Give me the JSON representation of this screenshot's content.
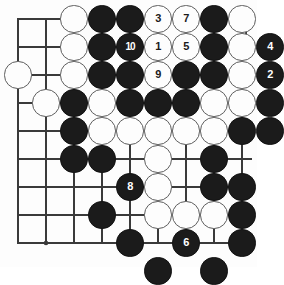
{
  "diagram": {
    "kind": "go-board-problem-diagram",
    "board": {
      "columns": 9,
      "rows": 9,
      "line_color": "#3a3a3a",
      "background_color": "#fdfdfd",
      "star_points": [
        [
          2,
          4
        ],
        [
          2,
          9
        ],
        [
          6,
          4
        ]
      ]
    },
    "colors": {
      "black_stone": "#1b1b1b",
      "white_stone": "#fdfdfd",
      "black_label": "#ffffff",
      "white_label": "#1b1b1b"
    },
    "stones": [
      {
        "col": 3,
        "row": 1,
        "color": "white",
        "label": ""
      },
      {
        "col": 4,
        "row": 1,
        "color": "black",
        "label": ""
      },
      {
        "col": 5,
        "row": 1,
        "color": "black",
        "label": ""
      },
      {
        "col": 6,
        "row": 1,
        "color": "white",
        "label": "3"
      },
      {
        "col": 7,
        "row": 1,
        "color": "white",
        "label": "7"
      },
      {
        "col": 8,
        "row": 1,
        "color": "black",
        "label": ""
      },
      {
        "col": 9,
        "row": 1,
        "color": "white",
        "label": ""
      },
      {
        "col": 3,
        "row": 2,
        "color": "white",
        "label": ""
      },
      {
        "col": 4,
        "row": 2,
        "color": "black",
        "label": ""
      },
      {
        "col": 5,
        "row": 2,
        "color": "black",
        "label": "10"
      },
      {
        "col": 6,
        "row": 2,
        "color": "white",
        "label": "1"
      },
      {
        "col": 7,
        "row": 2,
        "color": "white",
        "label": "5"
      },
      {
        "col": 8,
        "row": 2,
        "color": "black",
        "label": ""
      },
      {
        "col": 9,
        "row": 2,
        "color": "white",
        "label": ""
      },
      {
        "col": 10,
        "row": 2,
        "color": "black",
        "label": "4"
      },
      {
        "col": 1,
        "row": 3,
        "color": "white",
        "label": ""
      },
      {
        "col": 3,
        "row": 3,
        "color": "white",
        "label": ""
      },
      {
        "col": 4,
        "row": 3,
        "color": "black",
        "label": ""
      },
      {
        "col": 5,
        "row": 3,
        "color": "black",
        "label": ""
      },
      {
        "col": 6,
        "row": 3,
        "color": "white",
        "label": "9"
      },
      {
        "col": 7,
        "row": 3,
        "color": "black",
        "label": ""
      },
      {
        "col": 8,
        "row": 3,
        "color": "black",
        "label": ""
      },
      {
        "col": 9,
        "row": 3,
        "color": "white",
        "label": ""
      },
      {
        "col": 10,
        "row": 3,
        "color": "black",
        "label": "2"
      },
      {
        "col": 2,
        "row": 4,
        "color": "white",
        "label": ""
      },
      {
        "col": 3,
        "row": 4,
        "color": "black",
        "label": ""
      },
      {
        "col": 4,
        "row": 4,
        "color": "white",
        "label": ""
      },
      {
        "col": 5,
        "row": 4,
        "color": "black",
        "label": ""
      },
      {
        "col": 6,
        "row": 4,
        "color": "black",
        "label": ""
      },
      {
        "col": 7,
        "row": 4,
        "color": "black",
        "label": ""
      },
      {
        "col": 8,
        "row": 4,
        "color": "white",
        "label": ""
      },
      {
        "col": 9,
        "row": 4,
        "color": "white",
        "label": ""
      },
      {
        "col": 10,
        "row": 4,
        "color": "black",
        "label": ""
      },
      {
        "col": 3,
        "row": 5,
        "color": "black",
        "label": ""
      },
      {
        "col": 4,
        "row": 5,
        "color": "white",
        "label": ""
      },
      {
        "col": 5,
        "row": 5,
        "color": "white",
        "label": ""
      },
      {
        "col": 6,
        "row": 5,
        "color": "white",
        "label": ""
      },
      {
        "col": 7,
        "row": 5,
        "color": "white",
        "label": ""
      },
      {
        "col": 8,
        "row": 5,
        "color": "white",
        "label": ""
      },
      {
        "col": 9,
        "row": 5,
        "color": "black",
        "label": ""
      },
      {
        "col": 10,
        "row": 5,
        "color": "black",
        "label": ""
      },
      {
        "col": 3,
        "row": 6,
        "color": "black",
        "label": ""
      },
      {
        "col": 4,
        "row": 6,
        "color": "black",
        "label": ""
      },
      {
        "col": 6,
        "row": 6,
        "color": "white",
        "label": ""
      },
      {
        "col": 8,
        "row": 6,
        "color": "black",
        "label": ""
      },
      {
        "col": 5,
        "row": 7,
        "color": "black",
        "label": "8"
      },
      {
        "col": 6,
        "row": 7,
        "color": "white",
        "label": ""
      },
      {
        "col": 8,
        "row": 7,
        "color": "black",
        "label": ""
      },
      {
        "col": 9,
        "row": 7,
        "color": "black",
        "label": ""
      },
      {
        "col": 4,
        "row": 8,
        "color": "black",
        "label": ""
      },
      {
        "col": 6,
        "row": 8,
        "color": "white",
        "label": ""
      },
      {
        "col": 7,
        "row": 8,
        "color": "white",
        "label": ""
      },
      {
        "col": 8,
        "row": 8,
        "color": "white",
        "label": ""
      },
      {
        "col": 9,
        "row": 8,
        "color": "black",
        "label": ""
      },
      {
        "col": 5,
        "row": 9,
        "color": "black",
        "label": ""
      },
      {
        "col": 7,
        "row": 9,
        "color": "black",
        "label": "6"
      },
      {
        "col": 9,
        "row": 9,
        "color": "black",
        "label": ""
      },
      {
        "col": 6,
        "row": 10,
        "color": "black",
        "label": ""
      },
      {
        "col": 8,
        "row": 10,
        "color": "black",
        "label": ""
      }
    ]
  }
}
